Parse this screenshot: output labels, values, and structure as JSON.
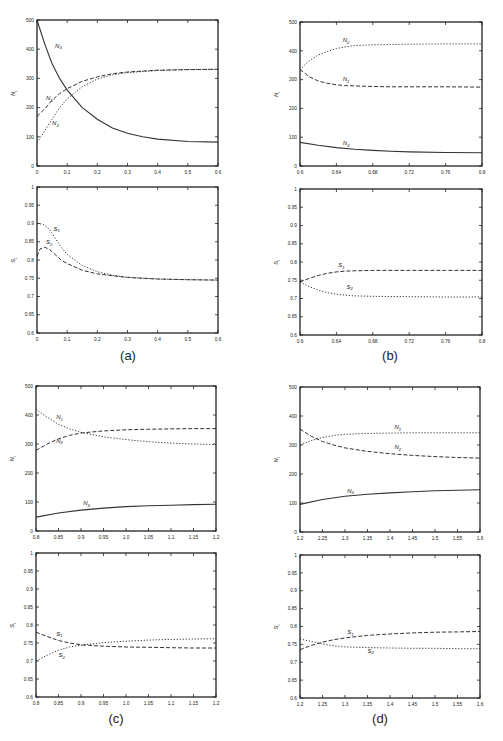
{
  "figure": {
    "captions": [
      "(a)",
      "(b)",
      "(c)",
      "(d)"
    ]
  },
  "chart_data": [
    {
      "id": "a-top",
      "panel": "(a)",
      "type": "line",
      "ylabel": "N_i",
      "xlabel": "",
      "xlim": [
        0,
        0.6
      ],
      "ylim": [
        0,
        500
      ],
      "xticks": [
        "0",
        "0.1",
        "0.2",
        "0.3",
        "0.4",
        "0.5",
        "0.6"
      ],
      "yticks": [
        "0",
        "100",
        "200",
        "300",
        "400",
        "500"
      ],
      "series": [
        {
          "name": "N_3",
          "style": "solid",
          "x": [
            0,
            0.025,
            0.05,
            0.075,
            0.1,
            0.15,
            0.2,
            0.25,
            0.3,
            0.35,
            0.4,
            0.5,
            0.6
          ],
          "y": [
            500,
            420,
            350,
            300,
            260,
            200,
            160,
            130,
            112,
            100,
            92,
            84,
            82
          ]
        },
        {
          "name": "N_1",
          "style": "dashed",
          "x": [
            0,
            0.025,
            0.05,
            0.075,
            0.1,
            0.15,
            0.2,
            0.25,
            0.3,
            0.4,
            0.5,
            0.6
          ],
          "y": [
            170,
            195,
            225,
            248,
            265,
            290,
            305,
            316,
            322,
            328,
            330,
            331
          ]
        },
        {
          "name": "N_2",
          "style": "dotted",
          "x": [
            0,
            0.025,
            0.05,
            0.075,
            0.1,
            0.15,
            0.2,
            0.25,
            0.3,
            0.4,
            0.5,
            0.6
          ],
          "y": [
            80,
            120,
            160,
            200,
            230,
            272,
            298,
            312,
            320,
            327,
            330,
            331
          ]
        }
      ],
      "labels": [
        {
          "text": "N_3",
          "x": 0.06,
          "y": 405
        },
        {
          "text": "N_1",
          "x": 0.03,
          "y": 225
        },
        {
          "text": "N_2",
          "x": 0.05,
          "y": 140
        }
      ]
    },
    {
      "id": "a-bottom",
      "panel": "(a)",
      "type": "line",
      "ylabel": "S_i",
      "xlabel": "",
      "xlim": [
        0,
        0.6
      ],
      "ylim": [
        0.6,
        1.0
      ],
      "xticks": [
        "0",
        "0.1",
        "0.2",
        "0.3",
        "0.4",
        "0.5",
        "0.6"
      ],
      "yticks": [
        "0.6",
        "0.65",
        "0.7",
        "0.75",
        "0.8",
        "0.85",
        "0.9",
        "0.95",
        "1"
      ],
      "series": [
        {
          "name": "S_1",
          "style": "dotted",
          "x": [
            0,
            0.02,
            0.04,
            0.06,
            0.08,
            0.1,
            0.15,
            0.2,
            0.25,
            0.3,
            0.4,
            0.5,
            0.6
          ],
          "y": [
            0.9,
            0.898,
            0.885,
            0.86,
            0.835,
            0.815,
            0.785,
            0.768,
            0.758,
            0.753,
            0.748,
            0.746,
            0.745
          ]
        },
        {
          "name": "S_2",
          "style": "dashed",
          "x": [
            0,
            0.01,
            0.025,
            0.04,
            0.06,
            0.08,
            0.1,
            0.15,
            0.2,
            0.3,
            0.4,
            0.5,
            0.6
          ],
          "y": [
            0.81,
            0.83,
            0.835,
            0.83,
            0.815,
            0.8,
            0.79,
            0.772,
            0.762,
            0.752,
            0.748,
            0.746,
            0.745
          ]
        }
      ],
      "labels": [
        {
          "text": "S_1",
          "x": 0.055,
          "y": 0.88
        },
        {
          "text": "S_2",
          "x": 0.03,
          "y": 0.843
        }
      ]
    },
    {
      "id": "b-top",
      "panel": "(b)",
      "type": "line",
      "ylabel": "N_i",
      "xlabel": "",
      "xlim": [
        0.6,
        0.8
      ],
      "ylim": [
        0,
        500
      ],
      "xticks": [
        "0.6",
        "0.64",
        "0.68",
        "0.72",
        "0.76",
        "0.8"
      ],
      "yticks": [
        "0",
        "100",
        "200",
        "300",
        "400",
        "500"
      ],
      "series": [
        {
          "name": "N_2",
          "style": "dotted",
          "x": [
            0.6,
            0.61,
            0.62,
            0.63,
            0.64,
            0.65,
            0.66,
            0.68,
            0.7,
            0.72,
            0.76,
            0.8
          ],
          "y": [
            335,
            365,
            385,
            398,
            408,
            414,
            418,
            421,
            422,
            423,
            424,
            424
          ]
        },
        {
          "name": "N_1",
          "style": "dashed",
          "x": [
            0.6,
            0.61,
            0.62,
            0.63,
            0.64,
            0.65,
            0.66,
            0.68,
            0.7,
            0.72,
            0.76,
            0.8
          ],
          "y": [
            335,
            310,
            295,
            287,
            282,
            279,
            278,
            276,
            275,
            275,
            275,
            274
          ]
        },
        {
          "name": "N_3",
          "style": "solid",
          "x": [
            0.6,
            0.62,
            0.64,
            0.66,
            0.68,
            0.7,
            0.72,
            0.76,
            0.8
          ],
          "y": [
            82,
            72,
            64,
            58,
            54,
            51,
            49,
            47,
            46
          ]
        }
      ],
      "labels": [
        {
          "text": "N_2",
          "x": 0.647,
          "y": 430
        },
        {
          "text": "N_1",
          "x": 0.647,
          "y": 295
        },
        {
          "text": "N_3",
          "x": 0.647,
          "y": 72
        }
      ]
    },
    {
      "id": "b-bottom",
      "panel": "(b)",
      "type": "line",
      "ylabel": "S_i",
      "xlabel": "",
      "xlim": [
        0.6,
        0.8
      ],
      "ylim": [
        0.6,
        1.0
      ],
      "xticks": [
        "0.6",
        "0.64",
        "0.68",
        "0.72",
        "0.76",
        "0.8"
      ],
      "yticks": [
        "0.6",
        "0.65",
        "0.7",
        "0.75",
        "0.8",
        "0.85",
        "0.9",
        "0.95",
        "1"
      ],
      "series": [
        {
          "name": "S_1",
          "style": "dashed",
          "x": [
            0.6,
            0.61,
            0.62,
            0.63,
            0.64,
            0.65,
            0.66,
            0.68,
            0.72,
            0.76,
            0.8
          ],
          "y": [
            0.745,
            0.755,
            0.763,
            0.769,
            0.773,
            0.775,
            0.776,
            0.777,
            0.777,
            0.777,
            0.777
          ]
        },
        {
          "name": "S_2",
          "style": "dotted",
          "x": [
            0.6,
            0.61,
            0.62,
            0.63,
            0.64,
            0.65,
            0.66,
            0.68,
            0.72,
            0.76,
            0.8
          ],
          "y": [
            0.745,
            0.733,
            0.723,
            0.716,
            0.712,
            0.709,
            0.707,
            0.706,
            0.705,
            0.704,
            0.704
          ]
        }
      ],
      "labels": [
        {
          "text": "S_1",
          "x": 0.642,
          "y": 0.786
        },
        {
          "text": "S_2",
          "x": 0.651,
          "y": 0.727
        }
      ]
    },
    {
      "id": "c-top",
      "panel": "(c)",
      "type": "line",
      "ylabel": "N_i",
      "xlabel": "",
      "xlim": [
        0.8,
        1.2
      ],
      "ylim": [
        0,
        500
      ],
      "xticks": [
        "0.8",
        "0.85",
        "0.9",
        "0.95",
        "1.0",
        "1.05",
        "1.1",
        "1.15",
        "1.2"
      ],
      "yticks": [
        "0",
        "100",
        "200",
        "300",
        "400",
        "500"
      ],
      "series": [
        {
          "name": "N_1",
          "style": "dotted",
          "x": [
            0.8,
            0.825,
            0.85,
            0.875,
            0.9,
            0.95,
            1.0,
            1.05,
            1.1,
            1.15,
            1.2
          ],
          "y": [
            420,
            392,
            368,
            352,
            340,
            325,
            315,
            308,
            303,
            300,
            298
          ]
        },
        {
          "name": "N_2",
          "style": "dashed",
          "x": [
            0.8,
            0.825,
            0.85,
            0.875,
            0.9,
            0.95,
            1.0,
            1.05,
            1.1,
            1.15,
            1.2
          ],
          "y": [
            278,
            300,
            318,
            330,
            338,
            345,
            349,
            351,
            352,
            353,
            353
          ]
        },
        {
          "name": "N_3",
          "style": "solid",
          "x": [
            0.8,
            0.85,
            0.9,
            0.95,
            1.0,
            1.05,
            1.1,
            1.15,
            1.2
          ],
          "y": [
            48,
            62,
            72,
            79,
            84,
            87,
            89,
            91,
            92
          ]
        }
      ],
      "labels": [
        {
          "text": "N_1",
          "x": 0.845,
          "y": 385
        },
        {
          "text": "N_2",
          "x": 0.845,
          "y": 305
        },
        {
          "text": "N_3",
          "x": 0.905,
          "y": 88
        }
      ]
    },
    {
      "id": "c-bottom",
      "panel": "(c)",
      "type": "line",
      "ylabel": "S_i",
      "xlabel": "",
      "xlim": [
        0.8,
        1.2
      ],
      "ylim": [
        0.6,
        1.0
      ],
      "xticks": [
        "0.8",
        "0.85",
        "0.9",
        "0.95",
        "1.0",
        "1.05",
        "1.1",
        "1.15",
        "1.2"
      ],
      "yticks": [
        "0.6",
        "0.65",
        "0.7",
        "0.75",
        "0.8",
        "0.85",
        "0.9",
        "0.95",
        "1"
      ],
      "series": [
        {
          "name": "S_1",
          "style": "dashed",
          "x": [
            0.8,
            0.825,
            0.85,
            0.875,
            0.9,
            0.95,
            1.0,
            1.05,
            1.1,
            1.15,
            1.2
          ],
          "y": [
            0.78,
            0.768,
            0.757,
            0.75,
            0.745,
            0.741,
            0.739,
            0.738,
            0.737,
            0.736,
            0.736
          ]
        },
        {
          "name": "S_2",
          "style": "dotted",
          "x": [
            0.8,
            0.825,
            0.85,
            0.875,
            0.9,
            0.95,
            1.0,
            1.05,
            1.1,
            1.15,
            1.2
          ],
          "y": [
            0.7,
            0.716,
            0.73,
            0.739,
            0.744,
            0.751,
            0.755,
            0.758,
            0.76,
            0.761,
            0.762
          ]
        }
      ],
      "labels": [
        {
          "text": "S_1",
          "x": 0.845,
          "y": 0.77
        },
        {
          "text": "S_2",
          "x": 0.85,
          "y": 0.71
        }
      ]
    },
    {
      "id": "d-top",
      "panel": "(d)",
      "type": "line",
      "ylabel": "N_i",
      "xlabel": "",
      "xlim": [
        1.2,
        1.6
      ],
      "ylim": [
        0,
        500
      ],
      "xticks": [
        "1.2",
        "1.25",
        "1.3",
        "1.35",
        "1.4",
        "1.45",
        "1.5",
        "1.55",
        "1.6"
      ],
      "yticks": [
        "0",
        "100",
        "200",
        "300",
        "400",
        "500"
      ],
      "series": [
        {
          "name": "N_1",
          "style": "dotted",
          "x": [
            1.2,
            1.225,
            1.25,
            1.275,
            1.3,
            1.35,
            1.4,
            1.45,
            1.5,
            1.55,
            1.6
          ],
          "y": [
            300,
            315,
            326,
            333,
            337,
            340,
            341,
            342,
            342,
            342,
            342
          ]
        },
        {
          "name": "N_2",
          "style": "dashed",
          "x": [
            1.2,
            1.225,
            1.25,
            1.275,
            1.3,
            1.35,
            1.4,
            1.45,
            1.5,
            1.55,
            1.6
          ],
          "y": [
            355,
            330,
            312,
            300,
            290,
            278,
            270,
            264,
            260,
            257,
            255
          ]
        },
        {
          "name": "N_3",
          "style": "solid",
          "x": [
            1.2,
            1.25,
            1.3,
            1.35,
            1.4,
            1.45,
            1.5,
            1.55,
            1.6
          ],
          "y": [
            95,
            112,
            123,
            130,
            135,
            139,
            142,
            144,
            146
          ]
        }
      ],
      "labels": [
        {
          "text": "N_1",
          "x": 1.41,
          "y": 355
        },
        {
          "text": "N_2",
          "x": 1.41,
          "y": 285
        },
        {
          "text": "N_3",
          "x": 1.305,
          "y": 135
        }
      ]
    },
    {
      "id": "d-bottom",
      "panel": "(d)",
      "type": "line",
      "ylabel": "S_i",
      "xlabel": "",
      "xlim": [
        1.2,
        1.6
      ],
      "ylim": [
        0.6,
        1.0
      ],
      "xticks": [
        "1.2",
        "1.25",
        "1.3",
        "1.35",
        "1.4",
        "1.45",
        "1.5",
        "1.55",
        "1.6"
      ],
      "yticks": [
        "0.6",
        "0.65",
        "0.7",
        "0.75",
        "0.8",
        "0.85",
        "0.9",
        "0.95",
        "1"
      ],
      "series": [
        {
          "name": "S_1",
          "style": "dashed",
          "x": [
            1.2,
            1.225,
            1.25,
            1.275,
            1.3,
            1.35,
            1.4,
            1.45,
            1.5,
            1.55,
            1.6
          ],
          "y": [
            0.735,
            0.747,
            0.756,
            0.763,
            0.768,
            0.775,
            0.779,
            0.782,
            0.784,
            0.785,
            0.786
          ]
        },
        {
          "name": "S_2",
          "style": "dotted",
          "x": [
            1.2,
            1.225,
            1.25,
            1.275,
            1.3,
            1.35,
            1.4,
            1.45,
            1.5,
            1.55,
            1.6
          ],
          "y": [
            0.765,
            0.758,
            0.751,
            0.746,
            0.743,
            0.741,
            0.74,
            0.739,
            0.739,
            0.738,
            0.738
          ]
        }
      ],
      "labels": [
        {
          "text": "S_1",
          "x": 1.305,
          "y": 0.778
        },
        {
          "text": "S_2",
          "x": 1.35,
          "y": 0.726
        }
      ]
    }
  ],
  "layout": {
    "panels": [
      {
        "chart": 0,
        "left": 37,
        "top": 20,
        "right": 218,
        "bottom": 166
      },
      {
        "chart": 1,
        "left": 37,
        "top": 187,
        "right": 218,
        "bottom": 333
      },
      {
        "chart": 2,
        "left": 300,
        "top": 22,
        "right": 482,
        "bottom": 166
      },
      {
        "chart": 3,
        "left": 300,
        "top": 189,
        "right": 482,
        "bottom": 335
      },
      {
        "chart": 4,
        "left": 36,
        "top": 386,
        "right": 216,
        "bottom": 531
      },
      {
        "chart": 5,
        "left": 36,
        "top": 553,
        "right": 216,
        "bottom": 697
      },
      {
        "chart": 6,
        "left": 300,
        "top": 387,
        "right": 480,
        "bottom": 532
      },
      {
        "chart": 7,
        "left": 300,
        "top": 555,
        "right": 480,
        "bottom": 698
      }
    ],
    "captions": [
      {
        "index": 0,
        "x": 128,
        "y": 350
      },
      {
        "index": 1,
        "x": 390,
        "y": 350
      },
      {
        "index": 2,
        "x": 116,
        "y": 713
      },
      {
        "index": 3,
        "x": 380,
        "y": 713
      }
    ]
  }
}
